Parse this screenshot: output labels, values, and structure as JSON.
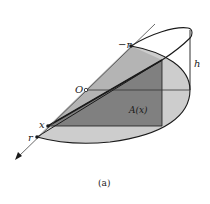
{
  "figure": {
    "caption": "(a)",
    "labels": {
      "neg_r": "−r",
      "origin": "O",
      "x": "x",
      "r": "r",
      "height": "h",
      "area": "A(x)"
    }
  },
  "colors": {
    "light_gray": "#c4c4c4",
    "mid_gray": "#a8a8a8",
    "dark_gray": "#7a7a7a",
    "stroke": "#1a1a1a",
    "thin_line": "#555555"
  }
}
